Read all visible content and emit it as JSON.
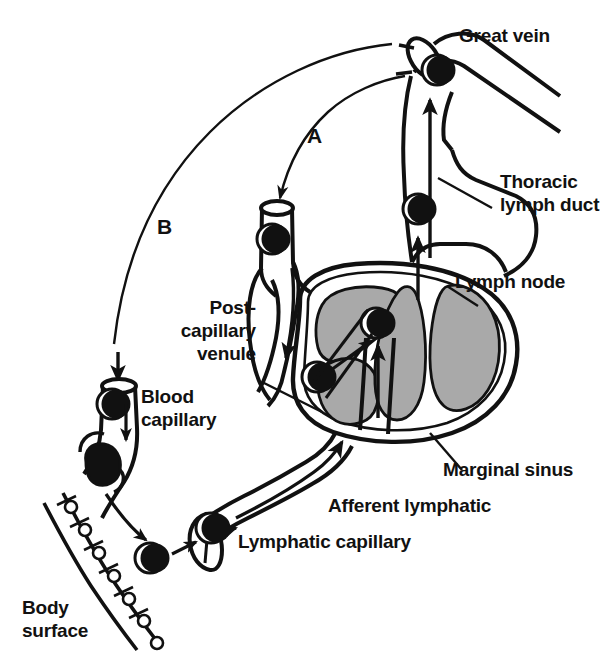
{
  "figure": {
    "type": "diagram",
    "background_color": "#ffffff",
    "ink_color": "#111111",
    "lobule_fill_color": "#a9a9a9",
    "cell_fill_color": "#111111"
  },
  "labels": {
    "great_vein": "Great vein",
    "thoracic_duct_line1": "Thoracic",
    "thoracic_duct_line2": "lymph duct",
    "lymph_node": "Lymph node",
    "post_capillary_line1": "Post-",
    "post_capillary_line2": "capillary",
    "post_capillary_line3": "venule",
    "blood_capillary_line1": "Blood",
    "blood_capillary_line2": "capillary",
    "marginal_sinus": "Marginal sinus",
    "afferent_lymphatic": "Afferent lymphatic",
    "lymphatic_capillary": "Lymphatic capillary",
    "body_surface_line1": "Body",
    "body_surface_line2": "surface",
    "path_a": "A",
    "path_b": "B"
  },
  "annotations": {
    "path_a_meaning": "A",
    "path_b_meaning": "B"
  }
}
